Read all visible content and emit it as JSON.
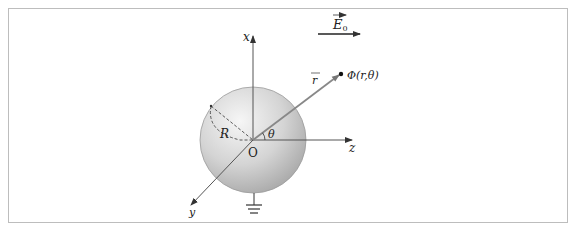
{
  "figure": {
    "field": {
      "label": "E",
      "subscript": "0",
      "has_vector_arrow": true
    },
    "axes": {
      "x": "x",
      "y": "y",
      "z": "z"
    },
    "origin_label": "O",
    "radius_label": "R",
    "angle_label": "θ",
    "position_vector_label": "r",
    "potential_label": "Φ(r,θ)",
    "ground_symbol": "ground-icon",
    "colors": {
      "sphere_light": "#f4f4f4",
      "sphere_dark": "#a8a8a8",
      "axis": "#555555",
      "radius_vector": "#888888",
      "frame": "#bdbdbd"
    }
  }
}
